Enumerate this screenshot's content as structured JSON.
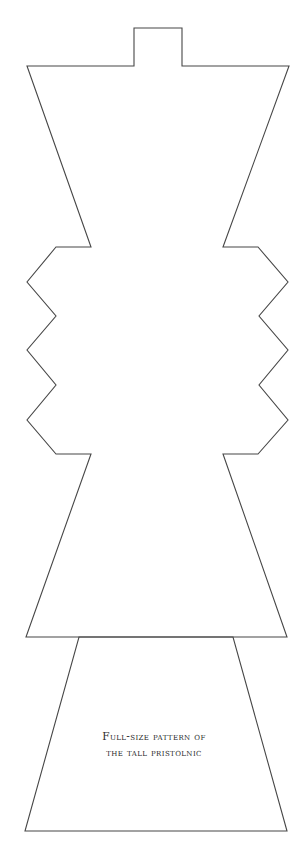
{
  "figure": {
    "caption_lines": [
      "Full-size pattern of",
      "the tall pristolnic"
    ],
    "stroke_color": "#474747",
    "background_color": "#ffffff",
    "pieces": {
      "upper_body": {
        "description": "Top tab, flared bowl, zigzag waist, flared skirt",
        "points": [
          [
            134,
            28
          ],
          [
            182,
            28
          ],
          [
            182,
            66
          ],
          [
            289,
            66
          ],
          [
            223,
            247
          ],
          [
            258,
            247
          ],
          [
            288,
            282
          ],
          [
            259,
            316
          ],
          [
            288,
            350
          ],
          [
            259,
            385
          ],
          [
            288,
            420
          ],
          [
            258,
            454
          ],
          [
            223,
            454
          ],
          [
            287,
            637
          ],
          [
            26,
            637
          ],
          [
            91,
            454
          ],
          [
            56,
            454
          ],
          [
            27,
            420
          ],
          [
            56,
            385
          ],
          [
            27,
            350
          ],
          [
            56,
            316
          ],
          [
            27,
            282
          ],
          [
            56,
            247
          ],
          [
            91,
            247
          ],
          [
            27,
            66
          ],
          [
            134,
            66
          ]
        ]
      },
      "base": {
        "description": "Lower trapezoid base",
        "points": [
          [
            79,
            637
          ],
          [
            233,
            637
          ],
          [
            287,
            831
          ],
          [
            25,
            831
          ]
        ]
      }
    }
  }
}
